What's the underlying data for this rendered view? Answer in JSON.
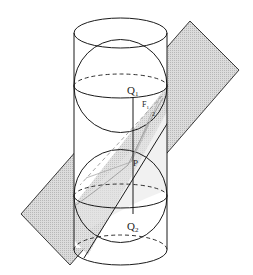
{
  "figure": {
    "colors": {
      "stroke": "#1a1a1a",
      "plane_fill": "#d2d2d2",
      "shadow_fill": "#e4e4e4",
      "faint": "#9a9a9a"
    },
    "labels": {
      "q1": "Q",
      "q1_sub": "1",
      "q2": "Q",
      "q2_sub": "2",
      "f1": "F",
      "f1_sub": "1",
      "p": "P",
      "f2_mark": "2"
    }
  }
}
